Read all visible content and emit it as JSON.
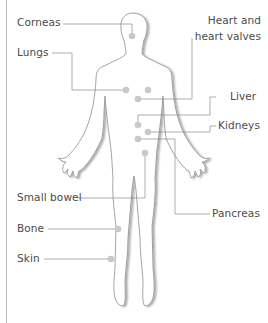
{
  "diagram": {
    "type": "anatomical-callout",
    "colors": {
      "outline": "#9a9a9a",
      "shadow": "#d0d0d0",
      "leader_line": "#8a8a8a",
      "dot": "#c9c9c9",
      "text": "#4a4a4a",
      "border": "#b9b9b9"
    },
    "labels": {
      "corneas": "Corneas",
      "lungs": "Lungs",
      "heart_line1": "Heart and",
      "heart_line2": "heart valves",
      "liver": "Liver",
      "kidneys": "Kidneys",
      "small_bowel": "Small bowel",
      "pancreas": "Pancreas",
      "bone": "Bone",
      "skin": "Skin"
    }
  }
}
